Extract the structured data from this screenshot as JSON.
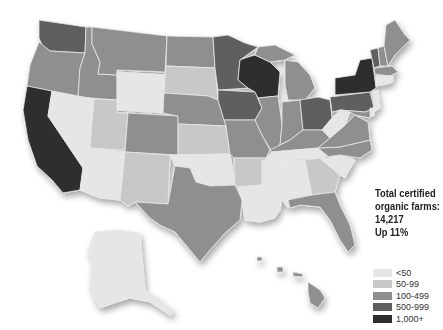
{
  "map": {
    "type": "choropleth",
    "region": "United States",
    "subject": "Certified organic farms by state",
    "summary": {
      "line1": "Total certified",
      "line2": "organic farms:",
      "total": "14,217",
      "change": "Up 11%"
    },
    "legend": [
      {
        "label": "<50",
        "color": "#e6e6e6"
      },
      {
        "label": "50-99",
        "color": "#c8c8c8"
      },
      {
        "label": "100-499",
        "color": "#8f8f8f"
      },
      {
        "label": "500-999",
        "color": "#5e5e5e"
      },
      {
        "label": "1,000+",
        "color": "#2e2e2e"
      }
    ],
    "states": {
      "WA": "500-999",
      "OR": "100-499",
      "CA": "1,000+",
      "ID": "100-499",
      "NV": "<50",
      "MT": "100-499",
      "WY": "<50",
      "UT": "50-99",
      "CO": "100-499",
      "AZ": "<50",
      "NM": "50-99",
      "ND": "100-499",
      "SD": "50-99",
      "NE": "100-499",
      "KS": "50-99",
      "OK": "<50",
      "TX": "100-499",
      "MN": "500-999",
      "IA": "500-999",
      "MO": "100-499",
      "AR": "50-99",
      "LA": "<50",
      "WI": "1,000+",
      "IL": "100-499",
      "MI": "100-499",
      "IN": "100-499",
      "OH": "500-999",
      "KY": "100-499",
      "TN": "<50",
      "MS": "<50",
      "AL": "<50",
      "GA": "50-99",
      "FL": "100-499",
      "SC": "<50",
      "NC": "100-499",
      "VA": "100-499",
      "WV": "<50",
      "PA": "500-999",
      "NY": "1,000+",
      "VT": "500-999",
      "NH": "100-499",
      "ME": "100-499",
      "MA": "100-499",
      "CT": "<50",
      "RI": "<50",
      "NJ": "<50",
      "DE": "<50",
      "MD": "100-499",
      "AK": "<50",
      "HI": "100-499"
    }
  }
}
